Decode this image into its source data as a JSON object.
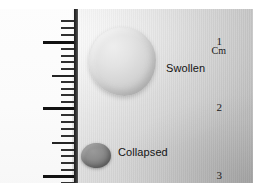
{
  "figure": {
    "caption_title": "Swollen and collapsed hydrogel samples beside a centimetre ruler",
    "background_color": "#c9c9c9",
    "paper_color": "#fbfbfb"
  },
  "ruler": {
    "unit_label": "Cm",
    "spine_color": "#1d1d1d",
    "major_labels": [
      {
        "value": "1",
        "y": 33
      },
      {
        "value": "2",
        "y": 99
      },
      {
        "value": "3",
        "y": 167
      }
    ],
    "tick_color": "#262626",
    "ticks": [
      {
        "type": "mm",
        "y": 12
      },
      {
        "type": "mm",
        "y": 19
      },
      {
        "type": "mm",
        "y": 26
      },
      {
        "type": "cm",
        "y": 33
      },
      {
        "type": "mm",
        "y": 40
      },
      {
        "type": "mm",
        "y": 47
      },
      {
        "type": "mm",
        "y": 53
      },
      {
        "type": "mm",
        "y": 60
      },
      {
        "type": "half",
        "y": 67
      },
      {
        "type": "mm",
        "y": 73
      },
      {
        "type": "mm",
        "y": 80
      },
      {
        "type": "mm",
        "y": 86
      },
      {
        "type": "mm",
        "y": 93
      },
      {
        "type": "cm",
        "y": 99
      },
      {
        "type": "mm",
        "y": 106
      },
      {
        "type": "mm",
        "y": 113
      },
      {
        "type": "mm",
        "y": 120
      },
      {
        "type": "mm",
        "y": 127
      },
      {
        "type": "half",
        "y": 134
      },
      {
        "type": "mm",
        "y": 141
      },
      {
        "type": "mm",
        "y": 147
      },
      {
        "type": "mm",
        "y": 154
      },
      {
        "type": "mm",
        "y": 161
      },
      {
        "type": "cm",
        "y": 167
      },
      {
        "type": "mm",
        "y": 174
      },
      {
        "type": "mm",
        "y": 180
      }
    ]
  },
  "samples": {
    "swollen": {
      "label": "Swollen",
      "color": "#d4d4d4",
      "approx_diameter_cm": "1.0"
    },
    "collapsed": {
      "label": "Collapsed",
      "color": "#7b7b7b",
      "approx_diameter_cm": "0.4"
    }
  }
}
